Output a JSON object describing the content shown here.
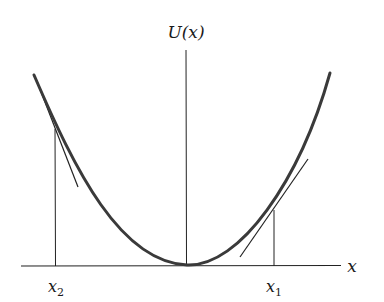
{
  "labels": {
    "y_axis": "U(x)",
    "x_axis": "x",
    "x1": "x",
    "x1_sub": "1",
    "x2": "x",
    "x2_sub": "2"
  },
  "colors": {
    "curve": "#3a3a3a",
    "lines": "#222222",
    "background": "#ffffff"
  },
  "geometry": {
    "x_axis": {
      "x1": 21,
      "y1": 266,
      "x2": 341,
      "y2": 265.5
    },
    "y_axis": {
      "x": 186,
      "y_top": 50,
      "y_bottom": 265
    },
    "curve": {
      "left_end": [
        34,
        75
      ],
      "minimum": [
        187,
        265
      ],
      "right_end": [
        330,
        73
      ]
    },
    "x2_marker": {
      "x": 55,
      "y_top": 130,
      "y_bottom": 266
    },
    "x1_marker": {
      "x": 274,
      "y_top": 210,
      "y_bottom": 266
    },
    "tangent_x2": {
      "from": [
        38,
        82
      ],
      "to": [
        78,
        187
      ]
    },
    "tangent_x1": {
      "from": [
        240,
        257
      ],
      "to": [
        308,
        159
      ]
    }
  }
}
